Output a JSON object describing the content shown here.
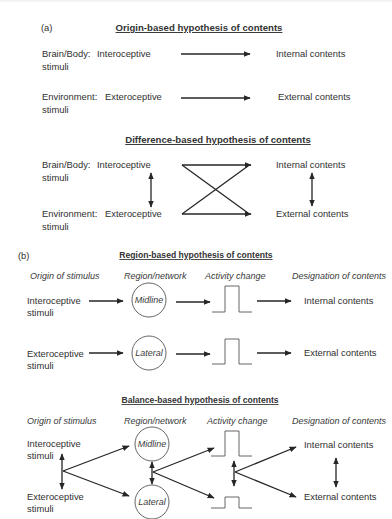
{
  "panel_a": {
    "label": "(a)",
    "origin": {
      "title": "Origin-based hypothesis of contents",
      "rows": [
        {
          "source": "Brain/Body:",
          "stimulus_line1": "Interoceptive",
          "stimulus_line2": "stimuli",
          "target": "Internal contents"
        },
        {
          "source": "Environment:",
          "stimulus_line1": "Exteroceptive",
          "stimulus_line2": "stimuli",
          "target": "External contents"
        }
      ]
    },
    "difference": {
      "title": "Difference-based hypothesis of contents",
      "rows": [
        {
          "source": "Brain/Body:",
          "stimulus_line1": "Interoceptive",
          "stimulus_line2": "stimuli",
          "target": "Internal contents"
        },
        {
          "source": "Environment:",
          "stimulus_line1": "Exteroceptive",
          "stimulus_line2": "stimuli",
          "target": "External contents"
        }
      ]
    }
  },
  "panel_b": {
    "label": "(b)",
    "region": {
      "title": "Region-based hypothesis of contents",
      "columns": [
        "Origin of stimulus",
        "Region/network",
        "Activity change",
        "Designation of contents"
      ],
      "rows": [
        {
          "stimulus_line1": "Interoceptive",
          "stimulus_line2": "stimuli",
          "region": "Midline",
          "target": "Internal contents"
        },
        {
          "stimulus_line1": "Exteroceptive",
          "stimulus_line2": "stimuli",
          "region": "Lateral",
          "target": "External contents"
        }
      ]
    },
    "balance": {
      "title": "Balance-based hypothesis of contents",
      "columns": [
        "Origin of stimulus",
        "Region/network",
        "Activity change",
        "Designation of contents"
      ],
      "rows": [
        {
          "stimulus_line1": "Interoceptive",
          "stimulus_line2": "stimuli",
          "region": "Midline",
          "target": "Internal contents"
        },
        {
          "stimulus_line1": "Exteroceptive",
          "stimulus_line2": "stimuli",
          "region": "Lateral",
          "target": "External contents"
        }
      ]
    }
  },
  "colors": {
    "line": "#262626",
    "text": "#2f2f2f",
    "background": "#ffffff"
  }
}
